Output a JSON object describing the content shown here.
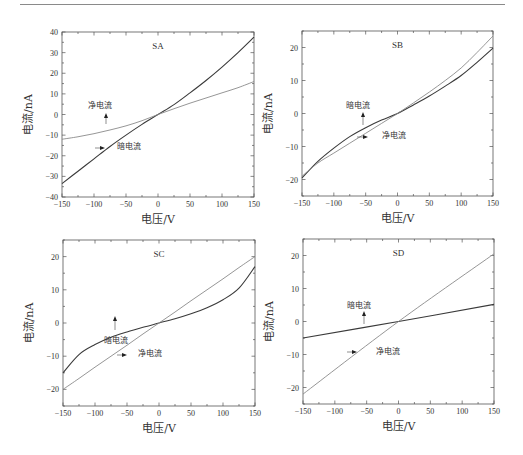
{
  "chart_data": [
    {
      "type": "line",
      "title": "SA",
      "xlabel": "电压/V",
      "ylabel": "电流/nA",
      "xlim": [
        -150,
        150
      ],
      "ylim": [
        -40,
        40
      ],
      "xticks": [
        -150,
        -100,
        -50,
        0,
        50,
        100,
        150
      ],
      "yticks": [
        -40,
        -30,
        -20,
        -10,
        0,
        10,
        20,
        30,
        40
      ],
      "x": [
        -150,
        -125,
        -100,
        -75,
        -50,
        -25,
        0,
        25,
        50,
        75,
        100,
        125,
        150
      ],
      "series": [
        {
          "name": "暗电流",
          "color": "#3a3a3a",
          "values": [
            -33.5,
            -27.5,
            -21.5,
            -15.5,
            -10.0,
            -4.8,
            0,
            4.8,
            10.5,
            16.5,
            23.0,
            30.0,
            37.5
          ]
        },
        {
          "name": "净电流",
          "color": "#8a8a8a",
          "values": [
            -12.0,
            -10.8,
            -9.3,
            -7.5,
            -5.5,
            -3.0,
            0,
            2.8,
            5.5,
            8.0,
            10.5,
            13.0,
            16.0
          ]
        }
      ],
      "annotations": [
        {
          "text": "净电流",
          "series": "净电流",
          "arrow": "up"
        },
        {
          "text": "暗电流",
          "series": "暗电流",
          "arrow": "left"
        }
      ]
    },
    {
      "type": "line",
      "title": "SB",
      "xlabel": "电压/V",
      "ylabel": "电流/nA",
      "xlim": [
        -150,
        150
      ],
      "ylim": [
        -25,
        25
      ],
      "xticks": [
        -150,
        -100,
        -50,
        0,
        50,
        100,
        150
      ],
      "yticks": [
        -20,
        -10,
        0,
        10,
        20
      ],
      "x": [
        -150,
        -125,
        -100,
        -75,
        -50,
        -25,
        0,
        25,
        50,
        75,
        100,
        125,
        150
      ],
      "series": [
        {
          "name": "暗电流",
          "color": "#3a3a3a",
          "values": [
            -19.5,
            -14.5,
            -10.5,
            -7.0,
            -4.3,
            -2.0,
            0,
            2.6,
            5.3,
            8.3,
            11.5,
            15.5,
            19.8
          ]
        },
        {
          "name": "净电流",
          "color": "#8a8a8a",
          "values": [
            -19.0,
            -15.0,
            -12.0,
            -9.0,
            -6.0,
            -3.0,
            0,
            3.2,
            6.5,
            10.0,
            13.8,
            18.5,
            23.5
          ]
        }
      ],
      "annotations": [
        {
          "text": "暗电流",
          "series": "暗电流",
          "arrow": "up"
        },
        {
          "text": "净电流",
          "series": "净电流",
          "arrow": "left"
        }
      ]
    },
    {
      "type": "line",
      "title": "SC",
      "xlabel": "电压/V",
      "ylabel": "电流/nA",
      "xlim": [
        -150,
        150
      ],
      "ylim": [
        -25,
        25
      ],
      "xticks": [
        -150,
        -100,
        -50,
        0,
        50,
        100,
        150
      ],
      "yticks": [
        -20,
        -10,
        0,
        10,
        20
      ],
      "x": [
        -150,
        -125,
        -100,
        -75,
        -50,
        -25,
        0,
        25,
        50,
        75,
        100,
        125,
        150
      ],
      "series": [
        {
          "name": "暗电流",
          "color": "#3a3a3a",
          "values": [
            -15.0,
            -9.5,
            -6.5,
            -4.3,
            -2.7,
            -1.3,
            0,
            1.3,
            2.8,
            4.6,
            7.0,
            10.5,
            17.0
          ]
        },
        {
          "name": "净电流",
          "color": "#8a8a8a",
          "values": [
            -20.0,
            -16.7,
            -13.3,
            -10.0,
            -6.7,
            -3.3,
            0,
            3.3,
            6.7,
            10.0,
            13.3,
            16.7,
            20.0
          ]
        }
      ],
      "annotations": [
        {
          "text": "暗电流",
          "series": "暗电流",
          "arrow": "up"
        },
        {
          "text": "净电流",
          "series": "净电流",
          "arrow": "left"
        }
      ]
    },
    {
      "type": "line",
      "title": "SD",
      "xlabel": "电压/V",
      "ylabel": "电流/nA",
      "xlim": [
        -150,
        150
      ],
      "ylim": [
        -25,
        25
      ],
      "xticks": [
        -150,
        -100,
        -50,
        0,
        50,
        100,
        150
      ],
      "yticks": [
        -20,
        -10,
        0,
        10,
        20
      ],
      "x": [
        -150,
        0,
        150
      ],
      "series": [
        {
          "name": "暗电流",
          "color": "#3a3a3a",
          "values": [
            -5.0,
            0,
            5.2
          ]
        },
        {
          "name": "净电流",
          "color": "#8a8a8a",
          "values": [
            -22.0,
            0,
            20.5
          ]
        }
      ],
      "annotations": [
        {
          "text": "暗电流",
          "series": "暗电流",
          "arrow": "up"
        },
        {
          "text": "净电流",
          "series": "净电流",
          "arrow": "left"
        }
      ]
    }
  ]
}
